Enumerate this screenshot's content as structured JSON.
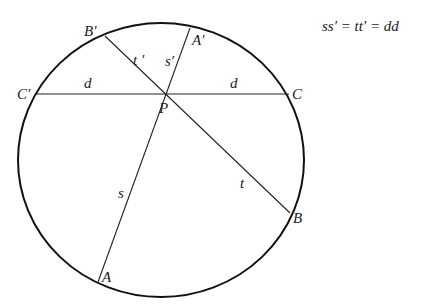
{
  "diagram": {
    "equation": "ss′ = tt′ = dd",
    "colors": {
      "stroke": "#111111",
      "background": "#ffffff"
    },
    "circle": {
      "cx": 161,
      "cy": 160,
      "rx": 143,
      "ry": 137
    },
    "points": {
      "P": {
        "label": "P",
        "x": 166,
        "y": 94
      },
      "A": {
        "label": "A",
        "x": 98,
        "y": 282
      },
      "A_prime": {
        "label": "A′",
        "x": 190,
        "y": 28
      },
      "B": {
        "label": "B",
        "x": 290,
        "y": 213
      },
      "B_prime": {
        "label": "B′",
        "x": 105,
        "y": 36
      },
      "C": {
        "label": "C",
        "x": 289,
        "y": 94
      },
      "C_prime": {
        "label": "C′",
        "x": 36,
        "y": 94
      }
    },
    "segment_labels": {
      "s": "s",
      "s_prime": "s′",
      "t": "t",
      "t_prime": "t ′",
      "d_left": "d",
      "d_right": "d"
    },
    "chords": [
      {
        "name": "AA'",
        "from": "A",
        "to": "A_prime"
      },
      {
        "name": "BB'",
        "from": "B",
        "to": "B_prime"
      },
      {
        "name": "CC'",
        "from": "C",
        "to": "C_prime"
      }
    ]
  }
}
